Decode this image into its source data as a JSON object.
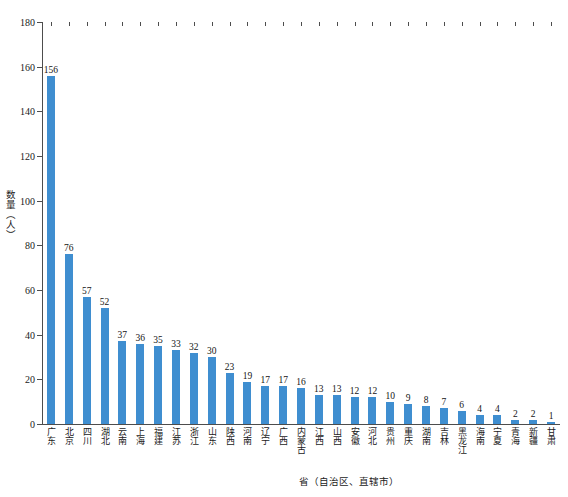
{
  "chart_data": {
    "type": "bar",
    "title": "",
    "xlabel": "省（自治区、直辖市）",
    "ylabel": "数量（人）",
    "ylim": [
      0,
      180
    ],
    "ytick_step": 20,
    "yticks": [
      0,
      20,
      40,
      60,
      80,
      100,
      120,
      140,
      160,
      180
    ],
    "grid": false,
    "legend": null,
    "bar_color": "#3f8ed0",
    "axis_color": "#4d4d4d",
    "text_color": "#1a1a1a",
    "categories": [
      "广东",
      "北京",
      "四川",
      "湖北",
      "云南",
      "上海",
      "福建",
      "江苏",
      "浙江",
      "山东",
      "陕西",
      "河南",
      "辽宁",
      "广西",
      "内蒙古",
      "江西",
      "山西",
      "安徽",
      "河北",
      "贵州",
      "重庆",
      "湖南",
      "吉林",
      "黑龙江",
      "海南",
      "宁夏",
      "青海",
      "新疆",
      "甘肃"
    ],
    "values": [
      156,
      76,
      57,
      52,
      37,
      36,
      35,
      33,
      32,
      30,
      23,
      19,
      17,
      17,
      16,
      13,
      13,
      12,
      12,
      10,
      9,
      8,
      7,
      6,
      4,
      4,
      2,
      2,
      1
    ],
    "value_labels": [
      "156",
      "76",
      "57",
      "52",
      "37",
      "36",
      "35",
      "33",
      "32",
      "30",
      "23",
      "19",
      "17",
      "17",
      "16",
      "13",
      "13",
      "12",
      "12",
      "10",
      "9",
      "8",
      "7",
      "6",
      "4",
      "4",
      "2",
      "2",
      "1"
    ],
    "ytick_labels": [
      "0",
      "20",
      "40",
      "60",
      "80",
      "100",
      "120",
      "140",
      "160",
      "180"
    ]
  }
}
